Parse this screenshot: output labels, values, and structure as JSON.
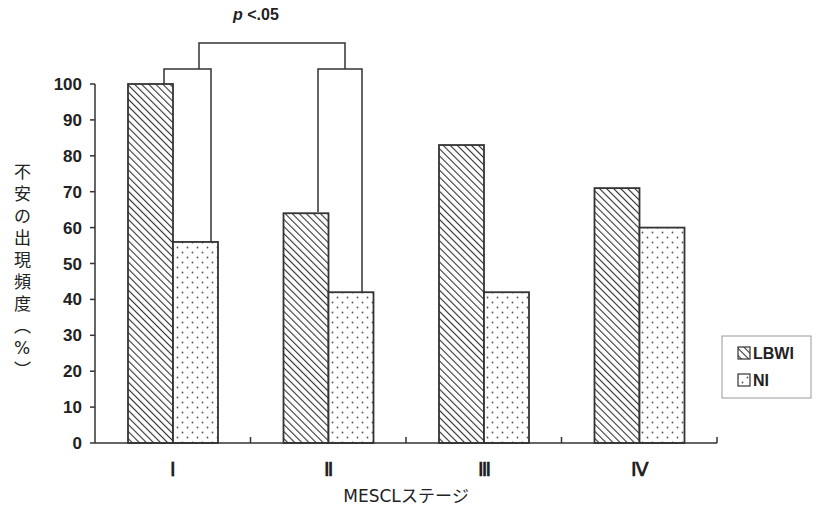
{
  "chart_data": {
    "type": "bar",
    "title": "",
    "xlabel": "MESCLステージ",
    "ylabel": "不安の出現頻度（%）",
    "ylim": [
      0,
      100
    ],
    "yticks": [
      0,
      10,
      20,
      30,
      40,
      50,
      60,
      70,
      80,
      90,
      100
    ],
    "categories": [
      "I",
      "II",
      "III",
      "IV"
    ],
    "series": [
      {
        "name": "LBWI",
        "pattern": "diagonal-hatch",
        "values": [
          100,
          64,
          83,
          71
        ]
      },
      {
        "name": "NI",
        "pattern": "dots",
        "values": [
          56,
          42,
          42,
          60
        ]
      }
    ],
    "grid": false,
    "legend_position": "right",
    "annotations": [
      {
        "text": "p <.05",
        "type": "significance-bracket",
        "between": [
          "I",
          "II"
        ]
      }
    ]
  },
  "labels": {
    "significance_p": "p",
    "significance_rest": " <.05",
    "xlabel": "MESCLステージ",
    "ylabel_chars": [
      "不",
      "安",
      "の",
      "出",
      "現",
      "頻",
      "度",
      "︵",
      "%",
      "︶"
    ],
    "legend": [
      "LBWI",
      "NI"
    ],
    "categories": [
      "I",
      "II",
      "III",
      "IV"
    ],
    "yticks": [
      "0",
      "10",
      "20",
      "30",
      "40",
      "50",
      "60",
      "70",
      "80",
      "90",
      "100"
    ]
  },
  "colors": {
    "stroke": "#333333",
    "background": "#ffffff"
  }
}
